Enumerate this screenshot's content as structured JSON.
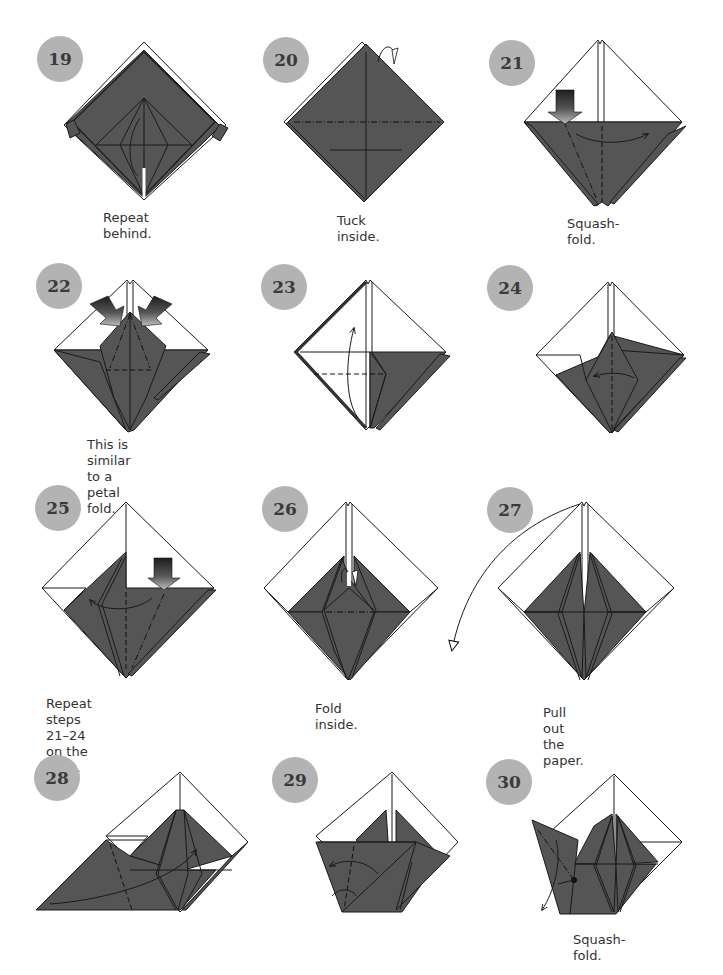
{
  "page": {
    "colors": {
      "paper_colored": "#555555",
      "paper_white": "#ffffff",
      "badge": "#b3b3b3",
      "line": "#1a1a1a",
      "push_arrow_dark": "#222222",
      "push_arrow_light": "#999999"
    },
    "steps": [
      {
        "number": "19",
        "caption": "Repeat behind.",
        "icons": [
          "diamond-model"
        ]
      },
      {
        "number": "20",
        "caption": "Tuck inside.",
        "icons": [
          "mountain-fold-line",
          "tuck-arrow"
        ]
      },
      {
        "number": "21",
        "caption": "Squash-fold.",
        "icons": [
          "push-arrow",
          "fold-arrow",
          "valley-fold-line",
          "mountain-fold-line"
        ]
      },
      {
        "number": "22",
        "caption": "This is similar\nto a petal fold.",
        "icons": [
          "push-arrow",
          "push-arrow"
        ]
      },
      {
        "number": "23",
        "caption": "",
        "icons": [
          "fold-up-arrow",
          "valley-fold-line"
        ]
      },
      {
        "number": "24",
        "caption": "",
        "icons": [
          "fold-arrow",
          "valley-fold-line"
        ]
      },
      {
        "number": "25",
        "caption": "Repeat steps 21–24\non the right.",
        "icons": [
          "push-arrow",
          "fold-arrow",
          "valley-fold-line",
          "mountain-fold-line"
        ]
      },
      {
        "number": "26",
        "caption": "Fold inside.",
        "icons": [
          "tuck-arrow",
          "mountain-fold-line"
        ]
      },
      {
        "number": "27",
        "caption": "Pull out the paper.",
        "icons": [
          "pull-arrow"
        ]
      },
      {
        "number": "28",
        "caption": "",
        "icons": [
          "fold-arrow",
          "valley-fold-line"
        ]
      },
      {
        "number": "29",
        "caption": "",
        "icons": [
          "fold-arrow",
          "valley-fold-line"
        ]
      },
      {
        "number": "30",
        "caption": "Squash-fold.",
        "icons": [
          "fold-arrow",
          "mountain-fold-line",
          "pivot-dot"
        ]
      }
    ]
  }
}
